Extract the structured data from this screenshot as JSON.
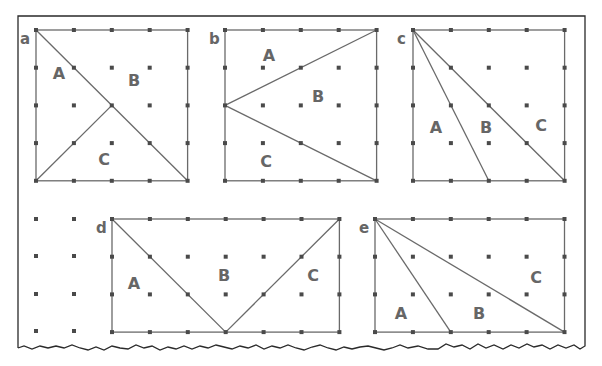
{
  "diagram": {
    "type": "geoboard-partitions",
    "grid_spacing_px": 37.8,
    "colors": {
      "frame": "#2a2a2a",
      "lines": "#6a6a6a",
      "dots": "#4a4a4a",
      "labels": "#666666"
    },
    "figures": [
      {
        "id": "a",
        "label": "a",
        "cols": 4,
        "rows": 4,
        "origin": [
          36,
          30
        ],
        "cuts": [
          [
            [
              0,
              0
            ],
            [
              4,
              4
            ]
          ],
          [
            [
              0,
              4
            ],
            [
              2,
              2
            ]
          ]
        ],
        "regions": [
          {
            "label": "A",
            "pos": [
              59,
              79
            ]
          },
          {
            "label": "B",
            "pos": [
              134,
              86
            ]
          },
          {
            "label": "C",
            "pos": [
              104,
              165
            ]
          }
        ]
      },
      {
        "id": "b",
        "label": "b",
        "cols": 4,
        "rows": 4,
        "origin": [
          225,
          30
        ],
        "cuts": [
          [
            [
              0,
              2
            ],
            [
              4,
              0
            ]
          ],
          [
            [
              0,
              2
            ],
            [
              4,
              4
            ]
          ]
        ],
        "regions": [
          {
            "label": "A",
            "pos": [
              269,
              61
            ]
          },
          {
            "label": "B",
            "pos": [
              318,
              102
            ]
          },
          {
            "label": "C",
            "pos": [
              266,
              167
            ]
          }
        ]
      },
      {
        "id": "c",
        "label": "c",
        "cols": 4,
        "rows": 4,
        "origin": [
          413,
          30
        ],
        "cuts": [
          [
            [
              0,
              0
            ],
            [
              2,
              4
            ]
          ],
          [
            [
              0,
              0
            ],
            [
              4,
              4
            ]
          ]
        ],
        "regions": [
          {
            "label": "A",
            "pos": [
              436,
              133
            ]
          },
          {
            "label": "B",
            "pos": [
              486,
              133
            ]
          },
          {
            "label": "C",
            "pos": [
              541,
              131
            ]
          }
        ]
      },
      {
        "id": "d",
        "label": "d",
        "cols": 6,
        "rows": 3,
        "origin": [
          112,
          219
        ],
        "cuts": [
          [
            [
              0,
              0
            ],
            [
              3,
              3
            ]
          ],
          [
            [
              3,
              3
            ],
            [
              6,
              0
            ]
          ]
        ],
        "regions": [
          {
            "label": "A",
            "pos": [
              134,
              289
            ]
          },
          {
            "label": "B",
            "pos": [
              224,
              281
            ]
          },
          {
            "label": "C",
            "pos": [
              313,
              281
            ]
          }
        ]
      },
      {
        "id": "e",
        "label": "e",
        "cols": 5,
        "rows": 3,
        "origin": [
          375,
          219
        ],
        "cuts": [
          [
            [
              0,
              0
            ],
            [
              2,
              3
            ]
          ],
          [
            [
              0,
              0
            ],
            [
              5,
              3
            ]
          ]
        ],
        "regions": [
          {
            "label": "A",
            "pos": [
              401,
              319
            ]
          },
          {
            "label": "B",
            "pos": [
              479,
              319
            ]
          },
          {
            "label": "C",
            "pos": [
              536,
              283
            ]
          }
        ]
      }
    ],
    "loose_dots": {
      "cols": [
        36,
        74
      ],
      "rows": [
        219,
        256,
        294,
        331
      ]
    }
  }
}
